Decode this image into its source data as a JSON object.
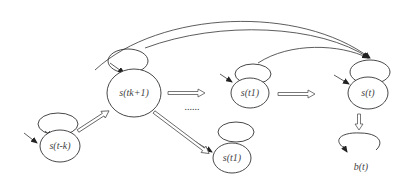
{
  "diagram": {
    "type": "state-transition",
    "nodes": [
      {
        "id": "s_t_minus_k",
        "label": "s(t-k)"
      },
      {
        "id": "s_tk_plus_1",
        "label": "s(tk+1)"
      },
      {
        "id": "s_t1_top",
        "label": "s(t1)"
      },
      {
        "id": "s_t1_bottom",
        "label": "s(t1)"
      },
      {
        "id": "s_t",
        "label": "s(t)"
      },
      {
        "id": "b_t",
        "label": "b(t)"
      }
    ],
    "ellipsis": "......",
    "edges": [
      {
        "from": "s_t_minus_k",
        "to": "s_tk_plus_1",
        "style": "double-arrow"
      },
      {
        "from": "s_tk_plus_1",
        "to": "s_t1_top",
        "style": "double-arrow"
      },
      {
        "from": "s_tk_plus_1",
        "to": "s_t1_bottom",
        "style": "double-arrow"
      },
      {
        "from": "s_t1_top",
        "to": "s_t",
        "style": "double-arrow"
      },
      {
        "from": "s_t",
        "to": "b_t",
        "style": "double-arrow"
      },
      {
        "from": "s_t_minus_k",
        "to": "s_t",
        "style": "curved-arrow"
      },
      {
        "from": "s_tk_plus_1",
        "to": "s_t",
        "style": "curved-arrow"
      },
      {
        "from": "s_t1_top",
        "to": "s_t",
        "style": "curved-arrow"
      },
      {
        "from": "s_t1_bottom",
        "to": "s_t",
        "style": "curved-arrow"
      }
    ]
  }
}
